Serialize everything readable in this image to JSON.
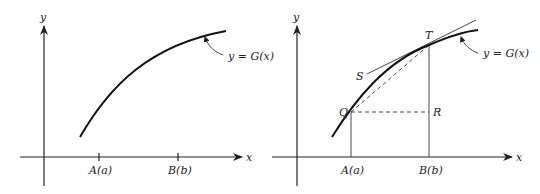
{
  "left_panel": {
    "y_axis_label": "y",
    "x_axis_label": "x",
    "tick_a_label": "A(a)",
    "tick_b_label": "B(b)",
    "curve_label": "y = G(x)"
  },
  "right_panel": {
    "y_axis_label": "y",
    "x_axis_label": "x",
    "tick_a_label": "A(a)",
    "tick_b_label": "B(b)",
    "curve_label": "y = G(x)",
    "point_t": "T",
    "point_s": "S",
    "point_q": "Q",
    "point_r": "R"
  }
}
